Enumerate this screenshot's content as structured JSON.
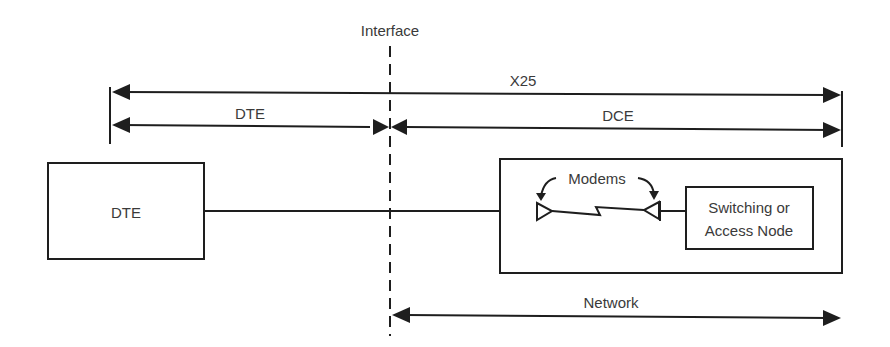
{
  "diagram": {
    "type": "network-architecture",
    "labels": {
      "interface": "Interface",
      "x25": "X25",
      "dte_span": "DTE",
      "dce_span": "DCE",
      "dte_box": "DTE",
      "modems": "Modems",
      "switching_line1": "Switching or",
      "switching_line2": "Access Node",
      "network": "Network"
    },
    "nodes": [
      {
        "id": "dte",
        "label": "DTE"
      },
      {
        "id": "modem-left",
        "label": "Modem"
      },
      {
        "id": "modem-right",
        "label": "Modem"
      },
      {
        "id": "switching-node",
        "label": "Switching or Access Node"
      },
      {
        "id": "network-box",
        "label": "Network"
      }
    ],
    "edges": [
      {
        "from": "dte",
        "to": "modem-left",
        "kind": "line"
      },
      {
        "from": "modem-left",
        "to": "modem-right",
        "kind": "lightning-link"
      },
      {
        "from": "modem-right",
        "to": "switching-node",
        "kind": "line"
      }
    ],
    "spans": [
      {
        "label": "X25",
        "from": "left-boundary",
        "to": "right-boundary"
      },
      {
        "label": "DTE",
        "from": "left-boundary",
        "to": "interface"
      },
      {
        "label": "DCE",
        "from": "interface",
        "to": "right-boundary"
      },
      {
        "label": "Network",
        "from": "interface",
        "to": "right-boundary"
      }
    ],
    "colors": {
      "line": "#1e1e1e",
      "text": "#3a3a3a",
      "background": "#ffffff"
    }
  }
}
